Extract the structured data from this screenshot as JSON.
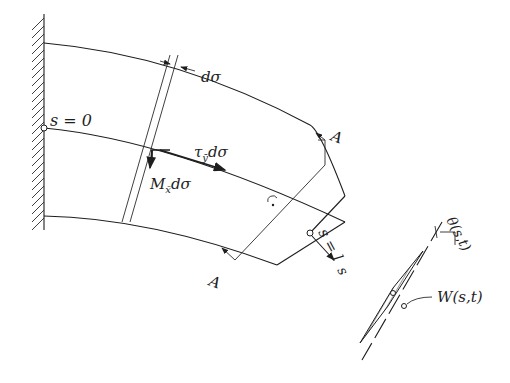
{
  "figure": {
    "labels": {
      "d_sigma": "dσ",
      "s_zero": "s = 0",
      "tau_y": "τ",
      "tau_y_sub": "ȳ",
      "tau_y_rest": "dσ",
      "m_x": "M",
      "m_x_sub": "x̄",
      "m_x_rest": "dσ",
      "section_top": "A",
      "section_bottom": "A",
      "s_end": "s = l",
      "s_axis": "s",
      "theta": "θ(s,t)",
      "w": "W(s,t)"
    },
    "colors": {
      "ink": "#1e1e1e",
      "background": "#ffffff"
    }
  }
}
